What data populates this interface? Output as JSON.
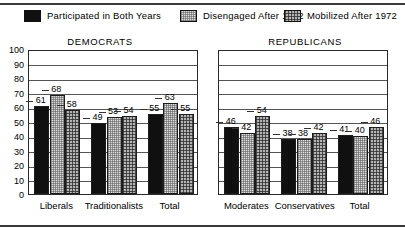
{
  "legend": {
    "items": [
      {
        "label": "Participated in Both Years",
        "swatch": "solid-black-swatch-icon",
        "color": "#101010"
      },
      {
        "label": "Disengaged After 1972",
        "swatch": "light-dotted-swatch-icon",
        "color": "#dcdcdc"
      },
      {
        "label": "Mobilized After 1972",
        "swatch": "gray-crosshatch-swatch-icon",
        "color": "#b4b4b4"
      }
    ]
  },
  "chart_data": {
    "type": "bar",
    "title": "",
    "panels": [
      {
        "title": "DEMOCRATS",
        "categories": [
          "Liberals",
          "Traditionalists",
          "Total"
        ],
        "series": [
          {
            "name": "Participated in Both Years",
            "values": [
              61,
              49,
              55
            ]
          },
          {
            "name": "Disengaged After 1972",
            "values": [
              68,
              53,
              63
            ]
          },
          {
            "name": "Mobilized After 1972",
            "values": [
              58,
              54,
              55
            ]
          }
        ],
        "yticks": [
          0,
          10,
          20,
          30,
          40,
          50,
          60,
          70,
          80,
          90,
          100
        ],
        "ylim": [
          0,
          100
        ],
        "ylabel": "",
        "xlabel": "",
        "grid": true,
        "show_yaxis_labels": true
      },
      {
        "title": "REPUBLICANS",
        "categories": [
          "Moderates",
          "Conservatives",
          "Total"
        ],
        "series": [
          {
            "name": "Participated in Both Years",
            "values": [
              46,
              38,
              41
            ]
          },
          {
            "name": "Disengaged After 1972",
            "values": [
              42,
              38,
              40
            ]
          },
          {
            "name": "Mobilized After 1972",
            "values": [
              54,
              42,
              46
            ]
          }
        ],
        "yticks": [
          0,
          10,
          20,
          30,
          40,
          50,
          60,
          70,
          80,
          90,
          100
        ],
        "ylim": [
          0,
          100
        ],
        "ylabel": "",
        "xlabel": "",
        "grid": true,
        "show_yaxis_labels": false
      }
    ],
    "legend_position": "top",
    "datalabels": true
  }
}
